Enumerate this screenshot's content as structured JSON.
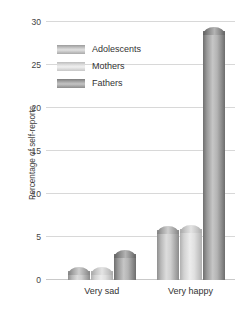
{
  "chart_data": {
    "type": "bar",
    "title": "",
    "xlabel": "",
    "ylabel": "Percentage of self-reports",
    "categories": [
      "Very sad",
      "Very happy"
    ],
    "series": [
      {
        "name": "Adolescents",
        "values": [
          1,
          5.8
        ],
        "color": "#c4c4c4"
      },
      {
        "name": "Mothers",
        "values": [
          1,
          5.9
        ],
        "color": "#e0e0e0"
      },
      {
        "name": "Fathers",
        "values": [
          3,
          29
        ],
        "color": "#9a9a9a"
      }
    ],
    "ylim": [
      0,
      30
    ],
    "yticks": [
      0,
      5,
      10,
      15,
      20,
      25,
      30
    ],
    "ytick_labels": [
      "0",
      "5",
      "10",
      "15",
      "20",
      "25",
      "30"
    ],
    "grid": true,
    "legend_position": "upper-left-inside"
  },
  "axis": {
    "y_title": "Percentage of self-reports",
    "ticks": [
      {
        "value": 30,
        "label": "30"
      },
      {
        "value": 25,
        "label": "25"
      },
      {
        "value": 20,
        "label": "20"
      },
      {
        "value": 15,
        "label": "15"
      },
      {
        "value": 10,
        "label": "10"
      },
      {
        "value": 5,
        "label": "5"
      },
      {
        "value": 0,
        "label": "0"
      }
    ],
    "x_categories": [
      {
        "label": "Very sad"
      },
      {
        "label": "Very happy"
      }
    ]
  },
  "legend": {
    "items": [
      {
        "label": "Adolescents",
        "swatch": "adolescents-swatch"
      },
      {
        "label": "Mothers",
        "swatch": "mothers-swatch"
      },
      {
        "label": "Fathers",
        "swatch": "fathers-swatch"
      }
    ]
  }
}
